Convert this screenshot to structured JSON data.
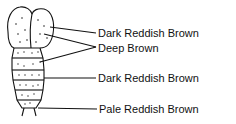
{
  "diagram": {
    "labels": [
      {
        "text": "Dark Reddish Brown",
        "part": "upper wing pads"
      },
      {
        "text": "Deep Brown",
        "part": "lower wing pads / first segments"
      },
      {
        "text": "Dark Reddish Brown",
        "part": "middle abdominal segments"
      },
      {
        "text": "Pale Reddish Brown",
        "part": "terminal segment"
      }
    ],
    "colors": {
      "line": "#111111",
      "background": "#ffffff"
    }
  }
}
